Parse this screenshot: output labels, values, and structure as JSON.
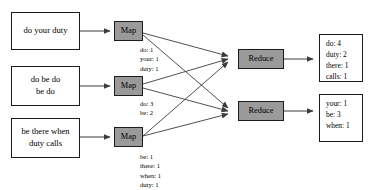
{
  "diagram": {
    "colors": {
      "node_fill": "#9a9a9a",
      "node_border": "#1c1c1c",
      "box_border": "#1a1a1a",
      "background": "#ffffff",
      "arrow": "#3c3c3c"
    }
  },
  "inputs": [
    {
      "id": "input-1",
      "lines": [
        "do your duty"
      ]
    },
    {
      "id": "input-2",
      "lines": [
        "do be do",
        "be do"
      ]
    },
    {
      "id": "input-3",
      "lines": [
        "be there when",
        "duty calls"
      ]
    }
  ],
  "mappers": [
    {
      "id": "map-1",
      "label": "Map"
    },
    {
      "id": "map-2",
      "label": "Map"
    },
    {
      "id": "map-3",
      "label": "Map"
    }
  ],
  "map_outputs": [
    {
      "id": "map-output-1",
      "pairs": [
        "do: 1",
        "your: 1",
        "duty: 1"
      ]
    },
    {
      "id": "map-output-2",
      "pairs": [
        "do: 3",
        "be: 2"
      ]
    },
    {
      "id": "map-output-3",
      "pairs": [
        "be: 1",
        "there: 1",
        "when: 1",
        "duty: 1",
        "calls: 1"
      ]
    }
  ],
  "reducers": [
    {
      "id": "reduce-1",
      "label": "Reduce"
    },
    {
      "id": "reduce-2",
      "label": "Reduce"
    }
  ],
  "results": [
    {
      "id": "result-1",
      "pairs": [
        "do: 4",
        "duty: 2",
        "there: 1",
        "calls: 1"
      ]
    },
    {
      "id": "result-2",
      "pairs": [
        "your: 1",
        "be: 3",
        "when: 1"
      ]
    }
  ]
}
